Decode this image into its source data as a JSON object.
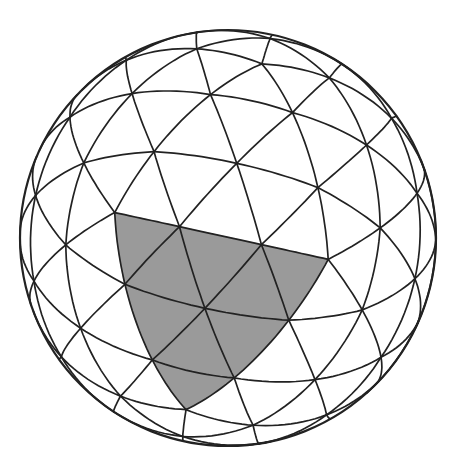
{
  "geometry": {
    "canvas": {
      "width": 458,
      "height": 469
    },
    "center": [
      228,
      238
    ],
    "radius": 208,
    "frequency": 3,
    "rotation_deg": {
      "x": -22,
      "y": 28,
      "z": 8
    }
  },
  "style": {
    "background": "#ffffff",
    "line_color": "#222222",
    "line_width": 1.7,
    "outline_width": 2.2,
    "shade_color": "#9a9a9a"
  },
  "highlight": {
    "label": "shaded icosahedron face",
    "sub_triangles": 9,
    "vertices_px": [
      [
        88,
        250
      ],
      [
        294,
        175
      ],
      [
        262,
        390
      ]
    ]
  }
}
